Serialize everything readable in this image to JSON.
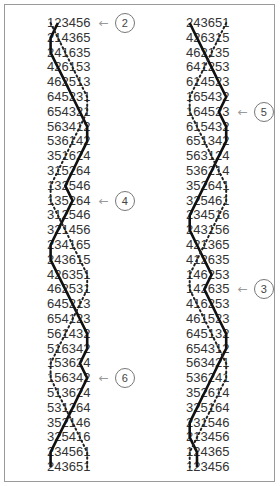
{
  "diagram": {
    "type": "change-ringing method diagram",
    "line_colors": {
      "bold": "#111111",
      "dotted": "#222222",
      "text": "#333333",
      "frame": "#9a9a9a"
    },
    "columns": [
      {
        "name": "left",
        "rows": [
          "123456",
          "214365",
          "241635",
          "426153",
          "462513",
          "645231",
          "654321",
          "563412",
          "536142",
          "351624",
          "315264",
          "132546",
          "135264",
          "312546",
          "321456",
          "234165",
          "243615",
          "426351",
          "462531",
          "645213",
          "654123",
          "561432",
          "516342",
          "153624",
          "156342",
          "513624",
          "531264",
          "352146",
          "325416",
          "234561",
          "243651"
        ]
      },
      {
        "name": "right",
        "rows": [
          "243651",
          "426315",
          "462135",
          "641253",
          "614523",
          "165432",
          "164523",
          "615432",
          "651342",
          "563124",
          "536214",
          "352641",
          "325461",
          "234516",
          "243156",
          "421365",
          "412635",
          "146253",
          "142635",
          "416253",
          "461523",
          "645132",
          "654312",
          "563421",
          "536241",
          "352614",
          "325164",
          "231546",
          "213456",
          "124365",
          "123456"
        ]
      }
    ],
    "callouts": [
      {
        "label": "2",
        "column": "left",
        "row": 0
      },
      {
        "label": "4",
        "column": "left",
        "row": 12
      },
      {
        "label": "6",
        "column": "left",
        "row": 24
      },
      {
        "label": "5",
        "column": "right",
        "row": 6
      },
      {
        "label": "3",
        "column": "right",
        "row": 18
      }
    ],
    "tracked_bells": {
      "bold": "2",
      "dotted": "1"
    }
  }
}
